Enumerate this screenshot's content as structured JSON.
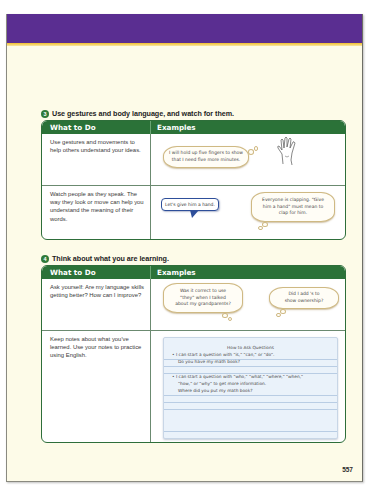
{
  "page": {
    "number": "557",
    "banner_color": "#5a2e91",
    "stripe_color": "#f2bf2c",
    "accent_green": "#2b7238"
  },
  "sections": [
    {
      "badge": "3",
      "heading": "Use gestures and body language, and watch for them.",
      "columns": [
        "What to Do",
        "Examples"
      ],
      "rows": [
        {
          "what": "Use gestures and movements to help others understand your ideas.",
          "examples": {
            "thought_bubble": "I will hold up five fingers to show that I need five more minutes.",
            "icon": "open-hand-icon"
          }
        },
        {
          "what": "Watch people as they speak. The way they look or move can help you understand the meaning of their words.",
          "examples": {
            "speech_bubble": "Let's give him a hand.",
            "thought_bubble": "Everyone is clapping. \"Give him a hand\" must mean to clap for him."
          }
        }
      ]
    },
    {
      "badge": "4",
      "heading": "Think about what you are learning.",
      "columns": [
        "What to Do",
        "Examples"
      ],
      "rows": [
        {
          "what": "Ask yourself: Are my language skills getting better? How can I improve?",
          "examples": {
            "thought_bubble_1": "Was it correct to use \"they\" when I talked about my grandparents?",
            "thought_bubble_2": "Did I add 's to show ownership?"
          }
        },
        {
          "what": "Keep notes about what you've learned. Use your notes to practice using English.",
          "examples": {
            "notes": {
              "title": "How to Ask Questions",
              "lines": [
                "• I can start a question with \"is,\" \"can,\" or \"do\".",
                "Do you have my math book?",
                "• I can start a question with \"who,\" \"what,\" \"where,\" \"when,\"",
                "\"how,\" or \"why\" to get more information.",
                "Where did you put my math book?"
              ]
            }
          }
        }
      ]
    }
  ]
}
